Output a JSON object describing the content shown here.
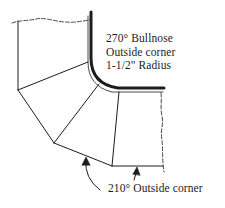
{
  "labels": {
    "bullnose": {
      "line1": "270° Bullnose",
      "line2": "Outside corner",
      "line3": "1-1/2\" Radius"
    },
    "outside_corner": "210° Outside corner"
  },
  "colors": {
    "line": "#1c1c1c",
    "background": "#ffffff"
  }
}
